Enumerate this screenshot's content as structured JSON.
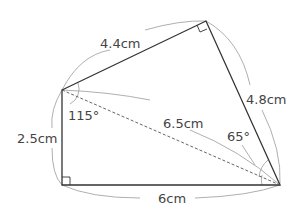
{
  "diagram": {
    "type": "quadrilateral-geometry",
    "vertices": {
      "A": [
        62,
        90
      ],
      "B": [
        206,
        21
      ],
      "C": [
        280,
        185
      ],
      "D": [
        62,
        185
      ]
    },
    "labels": {
      "ab": "4.4cm",
      "bc": "4.8cm",
      "ad": "2.5cm",
      "dc": "6cm",
      "ac": "6.5cm",
      "angle_a": "115°",
      "angle_c": "65°"
    },
    "colors": {
      "edge": "#333333",
      "arc": "#9a9a9a",
      "text": "#444444"
    }
  }
}
